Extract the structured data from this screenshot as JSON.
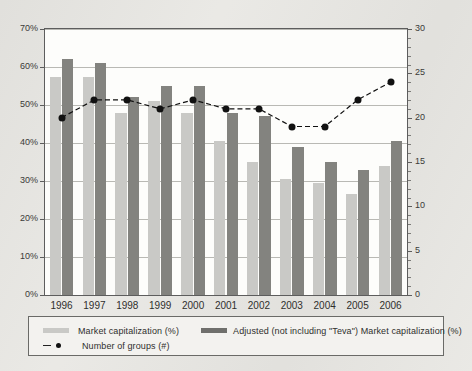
{
  "chart_data": {
    "type": "bar",
    "title": "",
    "subtitle": "",
    "xlabel": "",
    "ylabel": "",
    "y2label": "",
    "categories": [
      "1996",
      "1997",
      "1998",
      "1999",
      "2000",
      "2001",
      "2002",
      "2003",
      "2004",
      "2005",
      "2006"
    ],
    "ylim": [
      0,
      70
    ],
    "y2lim": [
      0,
      30
    ],
    "yticks": [
      "0%",
      "10%",
      "20%",
      "30%",
      "40%",
      "50%",
      "60%",
      "70%"
    ],
    "ytick_values": [
      0,
      10,
      20,
      30,
      40,
      50,
      60,
      70
    ],
    "y2ticks": [
      "0",
      "5",
      "10",
      "15",
      "20",
      "25",
      "30"
    ],
    "y2tick_values": [
      0,
      5,
      10,
      15,
      20,
      25,
      30
    ],
    "grid": true,
    "legend_position": "bottom",
    "series": [
      {
        "name": "Market capitalization (%)",
        "type": "bar",
        "axis": "left",
        "color": "#c9c9c6",
        "values": [
          57.5,
          57.5,
          48.0,
          51.0,
          48.0,
          40.5,
          35.0,
          30.5,
          29.5,
          26.5,
          34.0
        ]
      },
      {
        "name": "Adjusted (not including \"Teva\") Market capitalization (%)",
        "type": "bar",
        "axis": "left",
        "color": "#83837f",
        "values": [
          62.0,
          61.0,
          52.0,
          55.0,
          55.0,
          48.0,
          47.0,
          39.0,
          35.0,
          33.0,
          40.5
        ]
      },
      {
        "name": "Number of groups (#)",
        "type": "line",
        "axis": "right",
        "color": "#111111",
        "marker": "circle",
        "linestyle": "dashed",
        "values": [
          20,
          22,
          22,
          21,
          22,
          21,
          21,
          19,
          19,
          22,
          24
        ]
      }
    ]
  },
  "legend": {
    "items": [
      {
        "label": "Market capitalization (%)",
        "swatch": "light-bar-swatch"
      },
      {
        "label": "Adjusted (not including \"Teva\") Market capitalization (%)",
        "swatch": "dark-bar-swatch"
      },
      {
        "label": "Number of groups (#)",
        "swatch": "dashed-line-dot-swatch"
      }
    ]
  },
  "colors": {
    "light_bar": "#c9c9c6",
    "dark_bar": "#83837f",
    "line": "#111111",
    "grid": "#b9b9b4",
    "frame": "#5d5d5d",
    "page_background": "#e9e8e4",
    "plot_background": "#fdfdfb"
  }
}
